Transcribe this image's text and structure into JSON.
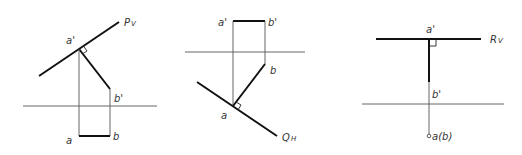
{
  "figures": [
    {
      "id": "plane-P",
      "trace_label": "P",
      "trace_sub": "V",
      "labels": {
        "a_prime": "a'",
        "b_prime": "b'",
        "a": "a",
        "b": "b"
      }
    },
    {
      "id": "plane-Q",
      "trace_label": "Q",
      "trace_sub": "H",
      "labels": {
        "a_prime": "a'",
        "b_prime": "b'",
        "a": "a",
        "b": "b"
      }
    },
    {
      "id": "plane-R",
      "trace_label": "R",
      "trace_sub": "V",
      "labels": {
        "a_prime": "a'",
        "b_prime": "b'",
        "ab": "a(b)"
      }
    }
  ]
}
